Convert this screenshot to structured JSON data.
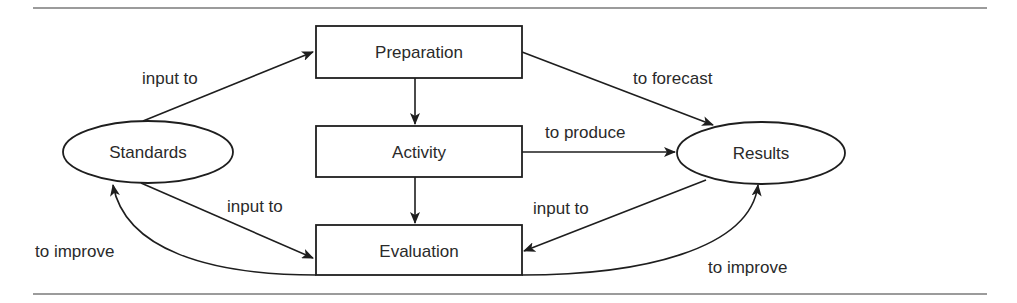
{
  "diagram": {
    "type": "flow-cycle",
    "colors": {
      "stroke": "#1e1e1e",
      "text": "#2a2a2a",
      "rule": "#7a7a7a",
      "background": "#ffffff"
    },
    "nodes": {
      "standards": {
        "label": "Standards",
        "shape": "ellipse"
      },
      "preparation": {
        "label": "Preparation",
        "shape": "rectangle"
      },
      "activity": {
        "label": "Activity",
        "shape": "rectangle"
      },
      "evaluation": {
        "label": "Evaluation",
        "shape": "rectangle"
      },
      "results": {
        "label": "Results",
        "shape": "ellipse"
      }
    },
    "edges": {
      "standards_to_preparation": {
        "from": "Standards",
        "to": "Preparation",
        "label": "input to"
      },
      "standards_to_evaluation": {
        "from": "Standards",
        "to": "Evaluation",
        "label": "input to"
      },
      "evaluation_to_standards": {
        "from": "Evaluation",
        "to": "Standards",
        "label": "to improve"
      },
      "preparation_to_activity": {
        "from": "Preparation",
        "to": "Activity",
        "label": ""
      },
      "activity_to_evaluation": {
        "from": "Activity",
        "to": "Evaluation",
        "label": ""
      },
      "preparation_to_results": {
        "from": "Preparation",
        "to": "Results",
        "label": "to forecast"
      },
      "activity_to_results": {
        "from": "Activity",
        "to": "Results",
        "label": "to produce"
      },
      "results_to_evaluation": {
        "from": "Results",
        "to": "Evaluation",
        "label": "input to"
      },
      "evaluation_to_results": {
        "from": "Evaluation",
        "to": "Results",
        "label": "to improve"
      }
    }
  }
}
